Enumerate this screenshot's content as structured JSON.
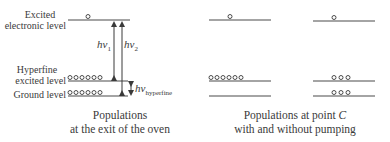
{
  "labels": {
    "excited_line1": "Excited",
    "excited_line2": "electronic level",
    "hyperfine_line1": "Hyperfine",
    "hyperfine_line2": "excited level",
    "ground": "Ground level",
    "h": "h",
    "nu1": "ν",
    "sub1": "1",
    "nu2": "ν",
    "sub2": "2",
    "hf_h": "h",
    "hf_nu": "ν",
    "hf_sub": "hyperfine"
  },
  "captions": {
    "left_line1": "Populations",
    "left_line2": "at the exit of the oven",
    "right_line1": "Populations at point ",
    "right_point": "C",
    "right_line2": "with and without pumping"
  },
  "populations": {
    "oven": {
      "excited": 1,
      "hyperfine": 6,
      "ground": 6
    },
    "with_pumping": {
      "excited": 1,
      "hyperfine": 6,
      "ground": 0
    },
    "without_pumping": {
      "excited": 1,
      "hyperfine": 3,
      "ground": 3
    }
  },
  "colors": {
    "line": "#4a4a4a",
    "text": "#3a3a3a"
  }
}
